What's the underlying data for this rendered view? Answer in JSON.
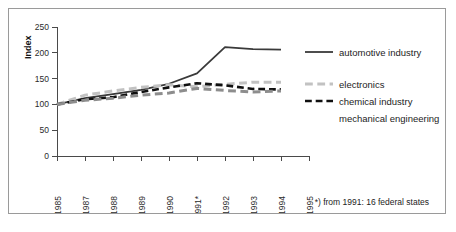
{
  "figure": {
    "footnote": "*) from 1991: 16 federal states"
  },
  "chart_data": {
    "type": "line",
    "title": "",
    "xlabel": "",
    "ylabel": "Index",
    "ylim": [
      0,
      250
    ],
    "yticks": [
      0,
      50,
      100,
      150,
      200,
      250
    ],
    "ytick_labels": [
      "0",
      "50",
      "100",
      "150",
      "200",
      "250"
    ],
    "grid": false,
    "legend_position": "right",
    "categories": [
      "1985",
      "1987",
      "1988",
      "1989",
      "1990",
      "1991*",
      "1992",
      "1993",
      "1994",
      "1995"
    ],
    "x": [
      1985,
      1987,
      1988,
      1989,
      1990,
      1991,
      1992,
      1993,
      1994,
      1995
    ],
    "series": [
      {
        "name": "automotive industry",
        "color": "#3a3a3a",
        "style": "solid",
        "width": 1.8,
        "values": [
          100,
          112,
          120,
          128,
          140,
          160,
          211,
          207,
          206,
          null
        ]
      },
      {
        "name": "electronics",
        "color": "#c2c2c2",
        "style": "dashed",
        "width": 3.0,
        "values": [
          100,
          118,
          126,
          133,
          138,
          134,
          139,
          143,
          143,
          null
        ]
      },
      {
        "name": "chemical industry",
        "color": "#101010",
        "style": "dashed",
        "width": 2.6,
        "values": [
          100,
          110,
          114,
          124,
          133,
          141,
          137,
          130,
          129,
          null
        ]
      },
      {
        "name": "mechanical engineering",
        "color": "#8d8d8d",
        "style": "dashed",
        "width": 3.0,
        "values": [
          100,
          108,
          112,
          118,
          122,
          131,
          127,
          124,
          126,
          null
        ]
      }
    ],
    "annotations": [
      "*) from 1991: 16 federal states"
    ]
  },
  "legend": {
    "items": [
      {
        "label": "automotive industry"
      },
      {
        "label": "electronics"
      },
      {
        "label": "chemical industry"
      },
      {
        "label": "mechanical engineering"
      }
    ]
  }
}
